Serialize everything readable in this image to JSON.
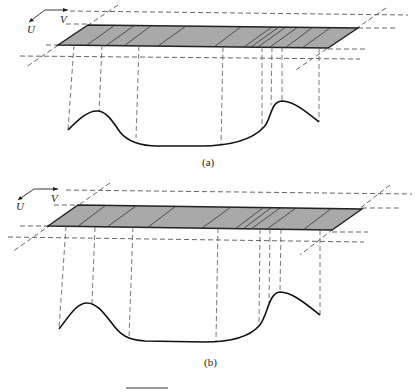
{
  "figure": {
    "panels": [
      {
        "id": "a",
        "caption": "(a)",
        "axis_labels": {
          "u": "U",
          "v": "V"
        }
      },
      {
        "id": "b",
        "caption": "(b)",
        "axis_labels": {
          "u": "U",
          "v": "V"
        }
      }
    ],
    "colors": {
      "tool_fill": "#a9a9a9",
      "outline": "#222222",
      "dashed": "#555555",
      "curve": "#111111"
    }
  }
}
